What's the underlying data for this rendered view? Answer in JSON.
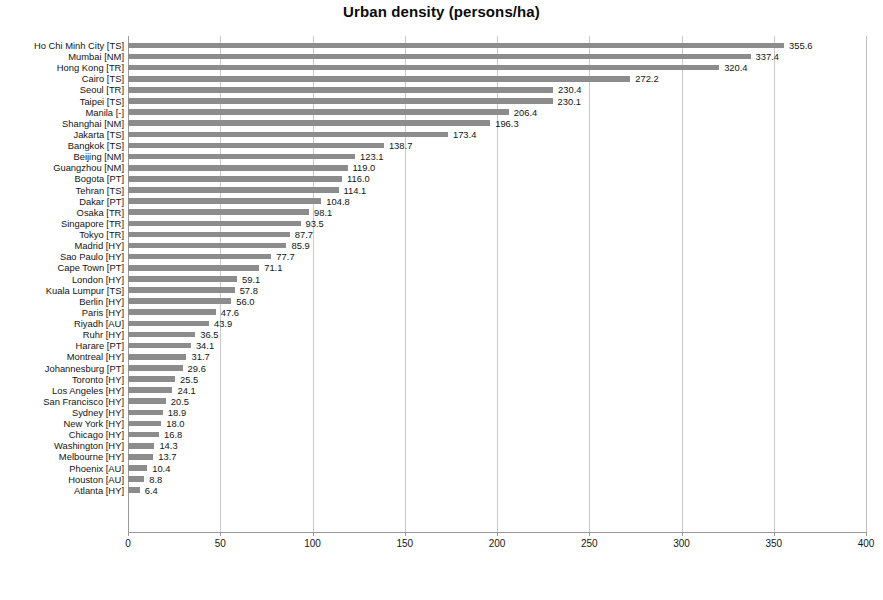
{
  "chart_data": {
    "type": "bar",
    "orientation": "horizontal",
    "title": "Urban density (persons/ha)",
    "xlabel": "",
    "ylabel": "",
    "xlim": [
      0,
      400
    ],
    "xticks": [
      0,
      50,
      100,
      150,
      200,
      250,
      300,
      350,
      400
    ],
    "xtick_labels": [
      "0",
      "50",
      "100",
      "150",
      "200",
      "250",
      "300",
      "350",
      "400"
    ],
    "grid": "vertical",
    "legend": "none",
    "bar_color": "#8c8c8c",
    "value_label_format": "one-decimal",
    "categories": [
      "Ho Chi Minh City [TS]",
      "Mumbai [NM]",
      "Hong Kong [TR]",
      "Cairo [TS]",
      "Seoul [TR]",
      "Taipei [TS]",
      "Manila [-]",
      "Shanghai [NM]",
      "Jakarta [TS]",
      "Bangkok [TS]",
      "Beijing [NM]",
      "Guangzhou [NM]",
      "Bogota [PT]",
      "Tehran [TS]",
      "Dakar [PT]",
      "Osaka [TR]",
      "Singapore [TR]",
      "Tokyo [TR]",
      "Madrid [HY]",
      "Sao Paulo [HY]",
      "Cape Town [PT]",
      "London [HY]",
      "Kuala Lumpur [TS]",
      "Berlin [HY]",
      "Paris [HY]",
      "Riyadh [AU]",
      "Ruhr [HY]",
      "Harare [PT]",
      "Montreal [HY]",
      "Johannesburg [PT]",
      "Toronto [HY]",
      "Los Angeles [HY]",
      "San Francisco [HY]",
      "Sydney [HY]",
      "New York [HY]",
      "Chicago [HY]",
      "Washington [HY]",
      "Melbourne [HY]",
      "Phoenix [AU]",
      "Houston [AU]",
      "Atlanta [HY]"
    ],
    "values": [
      355.6,
      337.4,
      320.4,
      272.2,
      230.4,
      230.1,
      206.4,
      196.3,
      173.4,
      138.7,
      123.1,
      119.0,
      116.0,
      114.1,
      104.8,
      98.1,
      93.5,
      87.7,
      85.9,
      77.7,
      71.1,
      59.1,
      57.8,
      56.0,
      47.6,
      43.9,
      36.5,
      34.1,
      31.7,
      29.6,
      25.5,
      24.1,
      20.5,
      18.9,
      18.0,
      16.8,
      14.3,
      13.7,
      10.4,
      8.8,
      6.4
    ],
    "value_labels": [
      "355.6",
      "337.4",
      "320.4",
      "272.2",
      "230.4",
      "230.1",
      "206.4",
      "196.3",
      "173.4",
      "138.7",
      "123.1",
      "119.0",
      "116.0",
      "114.1",
      "104.8",
      "98.1",
      "93.5",
      "87.7",
      "85.9",
      "77.7",
      "71.1",
      "59.1",
      "57.8",
      "56.0",
      "47.6",
      "43.9",
      "36.5",
      "34.1",
      "31.7",
      "29.6",
      "25.5",
      "24.1",
      "20.5",
      "18.9",
      "18.0",
      "16.8",
      "14.3",
      "13.7",
      "10.4",
      "8.8",
      "6.4"
    ]
  }
}
